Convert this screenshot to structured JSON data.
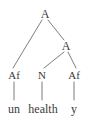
{
  "figure": {
    "kind": "syntax-tree",
    "background_color": "#ffffff",
    "text_color": "#3b3b3b",
    "edge_color": "#6e6e6e",
    "width": 93,
    "height": 121
  },
  "nodes": [
    {
      "id": "root-a",
      "label": "A",
      "x": 45,
      "y": 14,
      "level": 0
    },
    {
      "id": "inner-a",
      "label": "A",
      "x": 66,
      "y": 46,
      "level": 1
    },
    {
      "id": "prefix-af",
      "label": "Af",
      "x": 14,
      "y": 75,
      "level": 2
    },
    {
      "id": "stem-n",
      "label": "N",
      "x": 42,
      "y": 75,
      "level": 2
    },
    {
      "id": "suffix-af",
      "label": "Af",
      "x": 74,
      "y": 75,
      "level": 2
    },
    {
      "id": "word-un",
      "label": "un",
      "x": 14,
      "y": 109,
      "level": 3
    },
    {
      "id": "word-health",
      "label": "health",
      "x": 43,
      "y": 109,
      "level": 3
    },
    {
      "id": "word-y",
      "label": "y",
      "x": 74,
      "y": 109,
      "level": 3
    }
  ],
  "edges": [
    {
      "id": "edge-root-to-prefix",
      "from": "root-a",
      "to": "prefix-af",
      "x1": 42,
      "y1": 20,
      "x2": 13,
      "y2": 68
    },
    {
      "id": "edge-root-to-inner",
      "from": "root-a",
      "to": "inner-a",
      "x1": 48,
      "y1": 20,
      "x2": 64,
      "y2": 40
    },
    {
      "id": "edge-inner-to-stem",
      "from": "inner-a",
      "to": "stem-n",
      "x1": 64,
      "y1": 52,
      "x2": 44,
      "y2": 68
    },
    {
      "id": "edge-inner-to-suffix",
      "from": "inner-a",
      "to": "suffix-af",
      "x1": 68,
      "y1": 52,
      "x2": 76,
      "y2": 68
    },
    {
      "id": "edge-prefix-to-un",
      "from": "prefix-af",
      "to": "word-un",
      "x1": 14,
      "y1": 82,
      "x2": 14,
      "y2": 100
    },
    {
      "id": "edge-stem-to-health",
      "from": "stem-n",
      "to": "word-health",
      "x1": 42,
      "y1": 82,
      "x2": 42,
      "y2": 100
    },
    {
      "id": "edge-suffix-to-y",
      "from": "suffix-af",
      "to": "word-y",
      "x1": 74,
      "y1": 82,
      "x2": 74,
      "y2": 100
    }
  ]
}
